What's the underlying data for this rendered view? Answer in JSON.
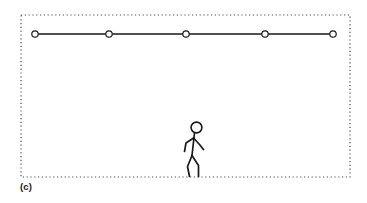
{
  "figure": {
    "panel_label": "(c)",
    "caption_position": "bottom-left",
    "background_color": "#ffffff",
    "stroke_color": "#1a1a1a",
    "boundary": {
      "name": "workspace-boundary",
      "style": "dotted",
      "x": 21,
      "y": 15,
      "width": 329,
      "height": 162,
      "dot_color": "#4d4d4d",
      "dot_size": 1.2,
      "dot_gap": 2.6
    },
    "trajectory": {
      "name": "waypoint-path",
      "line_color": "#1a1a1a",
      "line_width": 1.4,
      "node_fill": "#ffffff",
      "node_stroke": "#1a1a1a",
      "node_radius": 3.2,
      "node_stroke_width": 1.2,
      "y": 34,
      "nodes": [
        {
          "label": "node-1",
          "x": 35,
          "y": 34
        },
        {
          "label": "node-2",
          "x": 109,
          "y": 34
        },
        {
          "label": "node-3",
          "x": 186,
          "y": 34
        },
        {
          "label": "node-4",
          "x": 265,
          "y": 34
        },
        {
          "label": "node-5",
          "x": 333,
          "y": 34
        }
      ]
    },
    "actor": {
      "name": "walking-stick-figure",
      "stroke_color": "#1a1a1a",
      "stroke_width": 1.7,
      "head": {
        "cx": 196.5,
        "cy": 127.5,
        "r": 5.4,
        "stroke_width": 1.6
      },
      "spine": {
        "x1": 194.5,
        "y1": 133.0,
        "x2": 192.0,
        "y2": 155.5
      },
      "arm_back": {
        "x1": 193.6,
        "y1": 138.0,
        "x2": 186.0,
        "y2": 143.0,
        "x3": 184.5,
        "y3": 151.5
      },
      "arm_front": {
        "x1": 193.6,
        "y1": 138.0,
        "x2": 199.5,
        "y2": 144.5,
        "x3": 203.5,
        "y3": 149.5
      },
      "leg_back": {
        "x1": 192.0,
        "y1": 155.5,
        "x2": 187.5,
        "y2": 166.5,
        "x3": 189.5,
        "y3": 176.5
      },
      "leg_front": {
        "x1": 192.0,
        "y1": 155.5,
        "x2": 198.5,
        "y2": 165.5,
        "x3": 198.5,
        "y3": 176.5
      }
    }
  }
}
